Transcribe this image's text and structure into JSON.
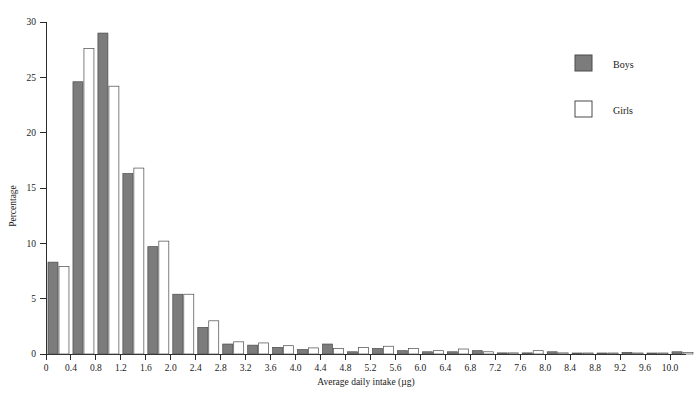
{
  "chart_data": {
    "type": "bar",
    "title": "",
    "subtitle": "",
    "xlabel": "Average daily intake (µg)",
    "ylabel": "Percentage",
    "xlim": [
      0,
      10.4
    ],
    "ylim": [
      0,
      30
    ],
    "grid": false,
    "legend_position": "top-right",
    "bin_width": 0.4,
    "x_tick_labels": [
      "0",
      "0.4",
      "0.8",
      "1.2",
      "1.6",
      "2.0",
      "2.4",
      "2.8",
      "3.2",
      "3.6",
      "4.0",
      "4.4",
      "4.8",
      "5.2",
      "5.6",
      "6.0",
      "6.4",
      "6.8",
      "7.2",
      "7.6",
      "8.0",
      "8.4",
      "8.8",
      "9.2",
      "9.6",
      "10.0"
    ],
    "x_tick_values": [
      0,
      0.4,
      0.8,
      1.2,
      1.6,
      2.0,
      2.4,
      2.8,
      3.2,
      3.6,
      4.0,
      4.4,
      4.8,
      5.2,
      5.6,
      6.0,
      6.4,
      6.8,
      7.2,
      7.6,
      8.0,
      8.4,
      8.8,
      9.2,
      9.6,
      10.0
    ],
    "y_tick_labels": [
      "0",
      "5",
      "10",
      "15",
      "20",
      "25",
      "30"
    ],
    "y_tick_values": [
      0,
      5,
      10,
      15,
      20,
      25,
      30
    ],
    "categories": [
      "0.0-0.4",
      "0.4-0.8",
      "0.8-1.2",
      "1.2-1.6",
      "1.6-2.0",
      "2.0-2.4",
      "2.4-2.8",
      "2.8-3.2",
      "3.2-3.6",
      "3.6-4.0",
      "4.0-4.4",
      "4.4-4.8",
      "4.8-5.2",
      "5.2-5.6",
      "5.6-6.0",
      "6.0-6.4",
      "6.4-6.8",
      "6.8-7.2",
      "7.2-7.6",
      "7.6-8.0",
      "8.0-8.4",
      "8.4-8.8",
      "8.8-9.2",
      "9.2-9.6",
      "9.6-10.0",
      "10.0-10.4"
    ],
    "bin_starts": [
      0.0,
      0.4,
      0.8,
      1.2,
      1.6,
      2.0,
      2.4,
      2.8,
      3.2,
      3.6,
      4.0,
      4.4,
      4.8,
      5.2,
      5.6,
      6.0,
      6.4,
      6.8,
      7.2,
      7.6,
      8.0,
      8.4,
      8.8,
      9.2,
      9.6,
      10.0
    ],
    "series": [
      {
        "name": "Boys",
        "color": "#7c7c7c",
        "values": [
          8.3,
          24.6,
          29.0,
          16.3,
          9.7,
          5.4,
          2.4,
          0.9,
          0.8,
          0.6,
          0.4,
          0.9,
          0.2,
          0.5,
          0.3,
          0.2,
          0.2,
          0.3,
          0.1,
          0.1,
          0.2,
          0.05,
          0.05,
          0.15,
          0.05,
          0.2
        ]
      },
      {
        "name": "Girls",
        "color": "#ffffff",
        "values": [
          7.9,
          27.6,
          24.2,
          16.8,
          10.2,
          5.4,
          3.0,
          1.1,
          1.0,
          0.75,
          0.55,
          0.5,
          0.6,
          0.7,
          0.5,
          0.3,
          0.45,
          0.2,
          0.1,
          0.3,
          0.1,
          0.05,
          0.05,
          0.05,
          0.05,
          0.15
        ]
      }
    ],
    "legend": [
      "Boys",
      "Girls"
    ]
  },
  "legend": {
    "boys_label": "Boys",
    "girls_label": "Girls"
  },
  "axes": {
    "x_title": "Average daily intake (µg)",
    "y_title": "Percentage"
  }
}
